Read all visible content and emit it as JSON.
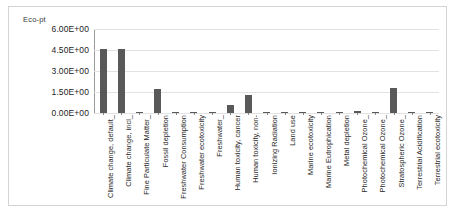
{
  "chart_data": {
    "type": "bar",
    "title": "",
    "ylabel": "Eco-pt",
    "xlabel": "",
    "ylim": [
      0,
      6
    ],
    "yticks": [
      0,
      1.5,
      3.0,
      4.5,
      6.0
    ],
    "ytick_labels": [
      "0.00E+00",
      "1.50E+00",
      "3.00E+00",
      "4.50E+00",
      "6.00E+00"
    ],
    "grid": true,
    "legend": "none",
    "bar_color": "#595959",
    "categories": [
      "Climate change, default_",
      "Climate change, incl_",
      "Fine Particulate Matter_",
      "Fossil depletion",
      "Freshwater Consumption",
      "Freshwater ecotoxicity",
      "Freshwater_",
      "Human toxicity, cancer",
      "Human toxicity, non-",
      "Ionizing Radiation",
      "Land use",
      "Marine ecotoxicity",
      "Marine Eutrophication",
      "Metal depletion",
      "Photochemical Ozone_",
      "Photochemical Ozone_",
      "Stratospheric Ozone_",
      "Terrestrial Acidification",
      "Terrestrial ecotoxicity"
    ],
    "values": [
      4.55,
      4.55,
      0.06,
      1.72,
      0.02,
      0.08,
      0.02,
      0.55,
      1.3,
      0.06,
      0.1,
      0.06,
      0.05,
      0.06,
      0.15,
      0.07,
      1.8,
      0.05,
      0.05
    ]
  },
  "axis": {
    "y_title": "Eco-pt"
  }
}
